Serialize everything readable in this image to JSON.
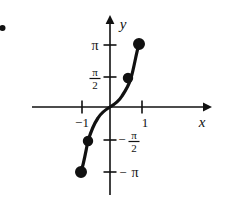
{
  "figure": {
    "name": "inverse-tangent-graph",
    "background_color": "#ffffff",
    "ink_color": "#111111",
    "corner_mark": "bullet"
  },
  "axes": {
    "x_axis_label": "x",
    "y_axis_label": "y",
    "origin_px": [
      110,
      107
    ],
    "x_axis_y_px": 107,
    "y_axis_x_px": 110,
    "x_arrow_end_px": 207,
    "y_arrow_end_px": 18,
    "x_axis_start_px": 32,
    "y_axis_end_px": 195,
    "unit_x_px": 32,
    "unit_y_px": 62
  },
  "x_ticks": [
    {
      "label": "−1",
      "value": -1,
      "x_px": 82,
      "label_x_px": 82,
      "label_y_px": 124
    },
    {
      "label": "1",
      "value": 1,
      "x_px": 142,
      "label_x_px": 144,
      "label_y_px": 124
    }
  ],
  "y_ticks": [
    {
      "label": "π",
      "kind": "plain",
      "value": 3.1416,
      "y_px": 45,
      "side": "left"
    },
    {
      "label": "π/2",
      "kind": "fraction",
      "numerator": "π",
      "denominator": "2",
      "value": 1.5708,
      "y_px": 77,
      "side": "left"
    },
    {
      "label": "−π/2",
      "kind": "fraction-negative",
      "numerator": "π",
      "denominator": "2",
      "sign": "−",
      "value": -1.5708,
      "y_px": 140,
      "side": "right"
    },
    {
      "label": "−π",
      "kind": "plain-negative",
      "sign": "−",
      "value": -3.1416,
      "y_px": 172,
      "side": "right"
    }
  ],
  "chart_data": {
    "type": "line",
    "title": "",
    "xlabel": "x",
    "ylabel": "y",
    "xlim": [
      -2.4,
      3.0
    ],
    "ylim": [
      -3.6,
      3.6
    ],
    "grid": false,
    "legend": null,
    "function": "y = arctan-like inverse tangent curve through origin",
    "series": [
      {
        "name": "inverse-tangent-curve",
        "x": [
          -0.92,
          -0.85,
          -0.75,
          -0.6,
          -0.45,
          -0.3,
          -0.15,
          0.0,
          0.15,
          0.3,
          0.45,
          0.6,
          0.75,
          0.85,
          0.92
        ],
        "y": [
          -3.14,
          -2.62,
          -1.9,
          -1.23,
          -0.82,
          -0.52,
          -0.25,
          0.0,
          0.25,
          0.52,
          0.82,
          1.23,
          1.9,
          2.62,
          3.14
        ],
        "path_px": "M 81,172 C 84,163 86,150 88,141 C 91,131 94,124 98,118 C 101,113 105,110 110,107 C 115,104 119,101 122,96 C 126,90 129,85 131,78 C 134,68 136,54 139,44",
        "linewidth_px": 3.2,
        "color": "#111111"
      }
    ],
    "points": [
      {
        "name": "upper-endpoint",
        "x": 0.92,
        "y": 3.1416,
        "px": [
          139,
          44
        ],
        "filled": true,
        "radius_px": 5.2
      },
      {
        "name": "upper-mid-point",
        "x": 0.6,
        "y": 1.5708,
        "px": [
          128,
          78
        ],
        "filled": true,
        "radius_px": 4.4
      },
      {
        "name": "lower-mid-point",
        "x": -0.6,
        "y": -1.5708,
        "px": [
          88,
          141
        ],
        "filled": true,
        "radius_px": 4.4
      },
      {
        "name": "lower-endpoint",
        "x": -0.92,
        "y": -3.1416,
        "px": [
          81,
          172
        ],
        "filled": true,
        "radius_px": 5.2
      }
    ],
    "annotations": []
  }
}
